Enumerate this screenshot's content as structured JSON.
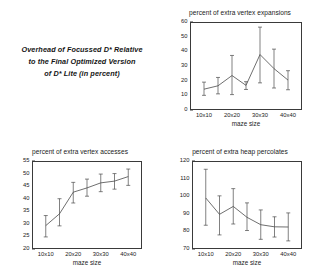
{
  "caption": {
    "line1": "Overhead of Focussed D* Relative",
    "line2": "to the Final Optimized Version",
    "line3": "of D* Lite (in percent)"
  },
  "colors": {
    "line": "#4a4a4a",
    "frame": "#3a3a3a",
    "grid": "#b9b9b9",
    "background": "#ffffff",
    "text": "#1a1a1a"
  },
  "chart_data": [
    {
      "type": "line",
      "name": "vertex-expansions",
      "title": "percent of extra vertex expansions",
      "xlabel": "maze size",
      "ylabel": "",
      "grid": true,
      "legend": "none",
      "categories": [
        "10x10",
        "20x20",
        "30x30",
        "40x40"
      ],
      "xtick_values": [
        10,
        20,
        30,
        40
      ],
      "xlim": [
        5,
        45
      ],
      "ylim": [
        0,
        60
      ],
      "ytick_labels": [
        "0",
        "10",
        "20",
        "30",
        "40",
        "50",
        "60"
      ],
      "ytick_values": [
        0,
        10,
        20,
        30,
        40,
        50,
        60
      ],
      "x": [
        10,
        15,
        20,
        25,
        30,
        35,
        40
      ],
      "values": [
        14.2,
        16.5,
        23.5,
        16.8,
        37.8,
        28.2,
        20.4
      ],
      "error_low": [
        10.0,
        11.0,
        10.5,
        14.0,
        18.5,
        15.0,
        13.8
      ],
      "error_high": [
        19.0,
        22.2,
        37.2,
        19.3,
        56.5,
        41.5,
        26.8
      ]
    },
    {
      "type": "line",
      "name": "vertex-accesses",
      "title": "percent of extra vertex accesses",
      "xlabel": "maze size",
      "ylabel": "",
      "grid": true,
      "legend": "none",
      "categories": [
        "10x10",
        "20x20",
        "30x30",
        "40x40"
      ],
      "xtick_values": [
        10,
        20,
        30,
        40
      ],
      "xlim": [
        5,
        45
      ],
      "ylim": [
        20,
        55
      ],
      "ytick_labels": [
        "20",
        "25",
        "30",
        "35",
        "40",
        "45",
        "50",
        "55"
      ],
      "ytick_values": [
        20,
        25,
        30,
        35,
        40,
        45,
        50,
        55
      ],
      "x": [
        10,
        15,
        20,
        25,
        30,
        35,
        40
      ],
      "values": [
        29.3,
        34.0,
        42.6,
        44.3,
        46.3,
        47.0,
        48.8
      ],
      "error_low": [
        24.8,
        29.2,
        38.3,
        41.0,
        42.8,
        43.8,
        45.3
      ],
      "error_high": [
        33.3,
        40.0,
        46.5,
        47.8,
        49.8,
        50.0,
        51.8
      ]
    },
    {
      "type": "line",
      "name": "heap-percolates",
      "title": "percent of extra heap percolates",
      "xlabel": "maze size",
      "ylabel": "",
      "grid": true,
      "legend": "none",
      "categories": [
        "10x10",
        "20x20",
        "30x30",
        "40x40"
      ],
      "xtick_values": [
        10,
        20,
        30,
        40
      ],
      "xlim": [
        5,
        45
      ],
      "ylim": [
        70,
        120
      ],
      "ytick_labels": [
        "70",
        "80",
        "90",
        "100",
        "110",
        "120"
      ],
      "ytick_values": [
        70,
        80,
        90,
        100,
        110,
        120
      ],
      "x": [
        10,
        15,
        20,
        25,
        30,
        35,
        40
      ],
      "values": [
        99.0,
        89.7,
        94.2,
        88.0,
        83.8,
        82.6,
        82.5
      ],
      "error_low": [
        83.5,
        78.0,
        84.2,
        80.5,
        75.5,
        76.8,
        74.6
      ],
      "error_high": [
        115.3,
        100.2,
        104.3,
        96.2,
        92.2,
        88.3,
        90.5
      ]
    }
  ]
}
